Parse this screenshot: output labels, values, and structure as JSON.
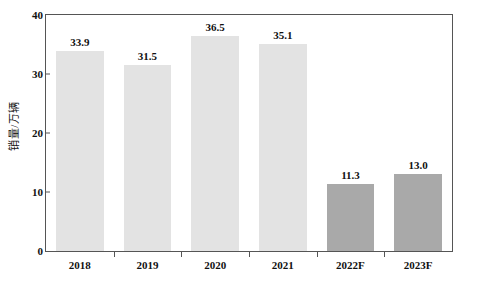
{
  "chart_data": {
    "type": "bar",
    "title": "",
    "subtitle": "",
    "xlabel": "",
    "ylabel": "销量/万辆",
    "categories": [
      "2018",
      "2019",
      "2020",
      "2021",
      "2022F",
      "2023F"
    ],
    "values": [
      33.9,
      31.5,
      36.5,
      35.1,
      11.3,
      13.0
    ],
    "value_labels": [
      "33.9",
      "31.5",
      "36.5",
      "35.1",
      "11.3",
      "13.0"
    ],
    "series": [
      {
        "name": "销量/万辆",
        "values": [
          33.9,
          31.5,
          36.5,
          35.1,
          11.3,
          13.0
        ]
      }
    ],
    "point_colors": [
      "#e3e3e3",
      "#e3e3e3",
      "#e3e3e3",
      "#e3e3e3",
      "#a9a9a9",
      "#a9a9a9"
    ],
    "ylim": [
      0,
      40
    ],
    "yticks": [
      0,
      10,
      20,
      30,
      40
    ],
    "ytick_labels": [
      "0",
      "10",
      "20",
      "30",
      "40"
    ],
    "grid": false,
    "legend": false,
    "legend_position": "none",
    "axis_color": "#555555",
    "text_color": "#111111",
    "background_color": "#ffffff",
    "historical_bar_color": "#e3e3e3",
    "forecast_bar_color": "#a9a9a9"
  }
}
